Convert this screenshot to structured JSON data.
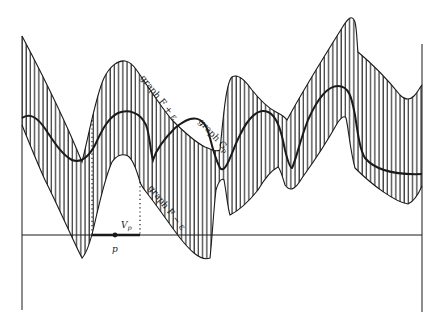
{
  "figure": {
    "labels": {
      "upper_curve": "graph F + ε",
      "lower_curve": "graph F − ε",
      "middle_curve": "graph G",
      "middle_curve_subscript": "p",
      "neighborhood": "V",
      "neighborhood_subscript": "p",
      "point": "p"
    },
    "colors": {
      "ink": "#1a1a1a",
      "background": "#ffffff"
    }
  }
}
